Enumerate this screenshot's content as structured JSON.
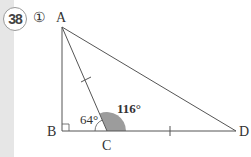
{
  "problem": {
    "number": "38",
    "sub_label": "①"
  },
  "figure": {
    "points": {
      "A": {
        "label": "A",
        "x": 62,
        "y": 27
      },
      "B": {
        "label": "B",
        "x": 62,
        "y": 131
      },
      "C": {
        "label": "C",
        "x": 107,
        "y": 131
      },
      "D": {
        "label": "D",
        "x": 236,
        "y": 131
      }
    },
    "angles": {
      "ACB": "64°",
      "ACD": "116°"
    },
    "colors": {
      "line": "#555555",
      "shaded_angle": "#999999"
    }
  }
}
